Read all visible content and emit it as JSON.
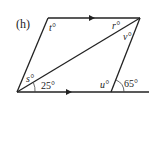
{
  "diagram": {
    "part_label": "(h)",
    "type": "parallelogram with diagonal and extended base",
    "vertices": {
      "top_left": [
        48,
        18
      ],
      "top_right": [
        140,
        18
      ],
      "bottom_left": [
        17,
        92
      ],
      "bottom_right": [
        111,
        92
      ],
      "base_extension_end": [
        149,
        92
      ]
    },
    "parallel_arrows": [
      "top side",
      "bottom side"
    ],
    "angle_labels": {
      "t": "t°",
      "r": "r°",
      "v": "v°",
      "s": "s°",
      "given_25": "25°",
      "u": "u°",
      "given_65": "65°"
    },
    "colors": {
      "stroke": "#222222",
      "background": "#ffffff"
    }
  }
}
